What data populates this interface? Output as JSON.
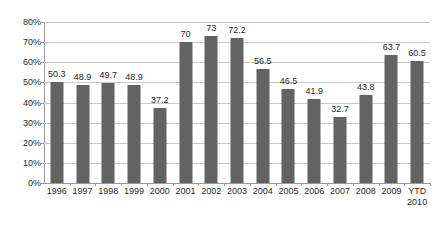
{
  "chart_data": {
    "type": "bar",
    "title": "",
    "subtitle": "",
    "xlabel": "",
    "ylabel": "",
    "categories": [
      "1996",
      "1997",
      "1998",
      "1999",
      "2000",
      "2001",
      "2002",
      "2003",
      "2004",
      "2005",
      "2006",
      "2007",
      "2008",
      "2009",
      "YTD\n2010"
    ],
    "values": [
      50.3,
      48.9,
      49.7,
      48.9,
      37.2,
      70,
      73,
      72.2,
      56.5,
      46.5,
      41.9,
      32.7,
      43.8,
      63.7,
      60.5
    ],
    "data_labels": [
      "50.3",
      "48.9",
      "49.7",
      "48.9",
      "37.2",
      "70",
      "73",
      "72.2",
      "56.5",
      "46.5",
      "41.9",
      "32.7",
      "43.8",
      "63.7",
      "60.5"
    ],
    "ylim": [
      0,
      80
    ],
    "ytick_values": [
      0,
      10,
      20,
      30,
      40,
      50,
      60,
      70,
      80
    ],
    "ytick_labels": [
      "0%",
      "10%",
      "20%",
      "30%",
      "40%",
      "50%",
      "60%",
      "70%",
      "80%"
    ],
    "grid": true,
    "legend": null,
    "legend_position": "none",
    "series": [
      {
        "name": "",
        "color": "#636363",
        "values": [
          50.3,
          48.9,
          49.7,
          48.9,
          37.2,
          70,
          73,
          72.2,
          56.5,
          46.5,
          41.9,
          32.7,
          43.8,
          63.7,
          60.5
        ]
      }
    ],
    "colors": {
      "bar": "#636363",
      "gridline": "#c9c9c9",
      "axis": "#9a9a9a",
      "text": "#2b2b2b",
      "background": "#ffffff"
    }
  }
}
